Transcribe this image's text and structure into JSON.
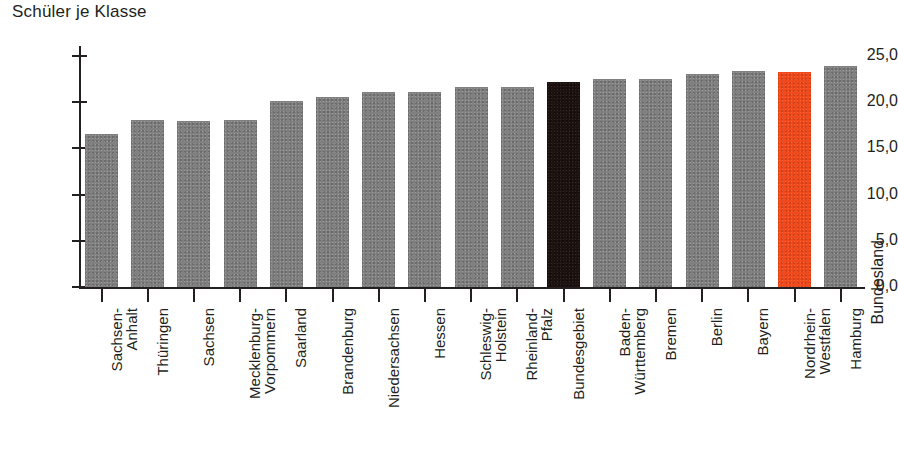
{
  "chart_data": {
    "type": "bar",
    "title": "Schüler je Klasse",
    "xlabel": "Bundesland",
    "ylabel": "",
    "ylim": [
      0,
      25
    ],
    "ytick_labels": [
      "0,0",
      "5,0",
      "10,0",
      "15,0",
      "20,0",
      "25,0"
    ],
    "ytick_values": [
      0,
      5,
      10,
      15,
      20,
      25
    ],
    "grid": false,
    "legend": "none",
    "categories": [
      "Sachsen-\nAnhalt",
      "Thüringen",
      "Sachsen",
      "Mecklenburg-\nVorpommern",
      "Saarland",
      "Brandenburg",
      "Niedersachsen",
      "Hessen",
      "Schleswig-\nHolstein",
      "Rheinland-\nPfalz",
      "Bundesgebiet",
      "Baden-\nWürttemberg",
      "Bremen",
      "Berlin",
      "Bayern",
      "Nordrhein-\nWestfalen",
      "Hamburg"
    ],
    "values": [
      16.6,
      18.1,
      18.0,
      18.1,
      20.1,
      20.6,
      21.1,
      21.1,
      21.6,
      21.6,
      22.2,
      22.5,
      22.5,
      23.0,
      23.4,
      23.3,
      23.9
    ],
    "bar_colors": [
      "#808080",
      "#808080",
      "#808080",
      "#808080",
      "#808080",
      "#808080",
      "#808080",
      "#808080",
      "#808080",
      "#808080",
      "#1c1210",
      "#808080",
      "#808080",
      "#808080",
      "#808080",
      "#f0491b",
      "#808080"
    ],
    "highlight_dark": "Bundesgebiet",
    "highlight_accent": "Nordrhein-Westfalen"
  },
  "colors": {
    "bar_gray": "#808080",
    "bar_black": "#1c1210",
    "bar_orange": "#f0491b",
    "axis": "#231f20",
    "background": "#ffffff"
  }
}
